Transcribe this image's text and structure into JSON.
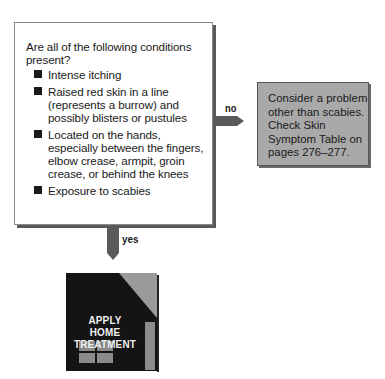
{
  "question": {
    "prompt": "Are all of the following conditions present?",
    "conditions": [
      "Intense itching",
      "Raised red skin in a line (represents a burrow) and possibly blisters or pustules",
      "Located on the hands, especially between the fingers, elbow crease, armpit, groin crease, or behind the knees",
      "Exposure to scabies"
    ]
  },
  "branches": {
    "no_label": "no",
    "yes_label": "yes"
  },
  "no_result": {
    "text": "Consider a problem other than scabies. Check Skin Symptom Table on pages 276–277."
  },
  "yes_result": {
    "line1": "APPLY",
    "line2": "HOME",
    "line3": "TREATMENT"
  },
  "colors": {
    "arrow": "#5a5a5a",
    "result_box_fill": "#a9a9a9",
    "house": "#141414",
    "house_roof": "#9a9a9a"
  }
}
